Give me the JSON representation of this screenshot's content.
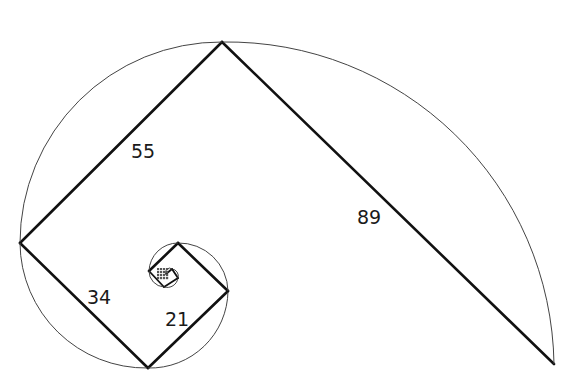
{
  "diagram": {
    "colors": {
      "line": "#111111",
      "arc": "#444444",
      "background": "#ffffff"
    },
    "segments": [
      {
        "label": "89",
        "from": [
          222,
          42
        ],
        "to": [
          554,
          364
        ],
        "arc_radius": 327,
        "sweep": 1
      },
      {
        "label": "55",
        "from": [
          20,
          243
        ],
        "to": [
          222,
          42
        ],
        "arc_radius": 201,
        "sweep": 1
      },
      {
        "label": "34",
        "from": [
          148,
          368
        ],
        "to": [
          20,
          243
        ],
        "arc_radius": 126,
        "sweep": 1
      },
      {
        "label": "21",
        "from": [
          228,
          291
        ],
        "to": [
          148,
          368
        ],
        "arc_radius": 78,
        "sweep": 1
      },
      {
        "label": "",
        "from": [
          178,
          243
        ],
        "to": [
          228,
          291
        ],
        "arc_radius": 49,
        "sweep": 1
      },
      {
        "label": "",
        "from": [
          149,
          271
        ],
        "to": [
          178,
          243
        ],
        "arc_radius": 29,
        "sweep": 1
      },
      {
        "label": "",
        "from": [
          164,
          287
        ],
        "to": [
          149,
          271
        ],
        "arc_radius": 16,
        "sweep": 1
      },
      {
        "label": "",
        "from": [
          178,
          278
        ],
        "to": [
          164,
          287
        ],
        "arc_radius": 11,
        "sweep": 1
      },
      {
        "label": "",
        "from": [
          172,
          269
        ],
        "to": [
          178,
          278
        ],
        "arc_radius": 7,
        "sweep": 1
      },
      {
        "label": "",
        "from": [
          166,
          274
        ],
        "to": [
          172,
          269
        ],
        "arc_radius": 4,
        "sweep": 1
      }
    ],
    "labels": [
      {
        "text": "89",
        "x": 357,
        "y": 208
      },
      {
        "text": "55",
        "x": 131,
        "y": 142
      },
      {
        "text": "34",
        "x": 87,
        "y": 288
      },
      {
        "text": "21",
        "x": 165,
        "y": 310
      }
    ]
  }
}
